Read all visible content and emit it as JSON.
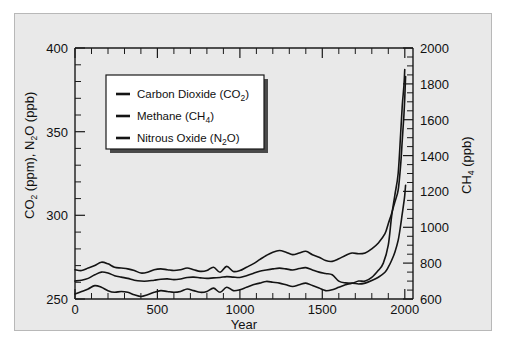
{
  "figure": {
    "background_color": "#e9e9e9",
    "page_color": "#ffffff",
    "line_color": "#141414"
  },
  "axes": {
    "x_label": "Year",
    "x_ticks": [
      "0",
      "500",
      "1000",
      "1500",
      "2000"
    ],
    "y_left_label_parts": {
      "a": "CO",
      "a_sub": "2",
      "b": " (ppm), N",
      "b_sub": "2",
      "c": "O (ppb)"
    },
    "y_left_ticks": [
      "250",
      "300",
      "350",
      "400"
    ],
    "y_right_label_parts": {
      "a": "CH",
      "a_sub": "4",
      "b": " (ppb)"
    },
    "y_right_ticks": [
      "600",
      "800",
      "1000",
      "1200",
      "1400",
      "1600",
      "1800",
      "2000"
    ]
  },
  "legend": {
    "items": [
      {
        "label_main": "Carbon Dioxide (CO",
        "label_sub": "2",
        "label_end": ")",
        "name": "carbon-dioxide"
      },
      {
        "label_main": "Methane (CH",
        "label_sub": "4",
        "label_end": ")",
        "name": "methane"
      },
      {
        "label_main": "Nitrous Oxide (N",
        "label_sub": "2",
        "label_end": "O)",
        "name": "nitrous-oxide"
      }
    ]
  },
  "chart_data": {
    "type": "line",
    "title": "",
    "xlabel": "Year",
    "ylabel": "CO2 (ppm), N2O (ppb)",
    "ylabel_right": "CH4 (ppb)",
    "xlim": [
      0,
      2050
    ],
    "ylim_left": [
      250,
      400
    ],
    "ylim_right": [
      600,
      2000
    ],
    "grid": false,
    "legend_position": "upper-left-inside",
    "series": [
      {
        "name": "Carbon Dioxide (CO2)",
        "unit": "ppm",
        "axis": "left",
        "x": [
          0,
          40,
          80,
          120,
          160,
          200,
          240,
          280,
          320,
          360,
          400,
          440,
          480,
          520,
          560,
          600,
          640,
          680,
          720,
          760,
          800,
          840,
          880,
          920,
          960,
          1000,
          1040,
          1080,
          1120,
          1160,
          1200,
          1240,
          1280,
          1320,
          1360,
          1400,
          1440,
          1480,
          1520,
          1560,
          1600,
          1640,
          1680,
          1720,
          1760,
          1800,
          1840,
          1880,
          1900,
          1920,
          1940,
          1960,
          1975,
          1985,
          1995,
          2000,
          2005
        ],
        "y": [
          267.5,
          267.0,
          268.5,
          270.0,
          272.0,
          271.0,
          269.0,
          268.5,
          268.0,
          267.0,
          265.5,
          266.0,
          267.5,
          268.0,
          267.5,
          267.0,
          267.5,
          268.5,
          267.5,
          266.5,
          267.0,
          269.0,
          266.0,
          269.5,
          266.5,
          267.0,
          269.0,
          271.0,
          273.5,
          276.0,
          278.0,
          279.0,
          278.0,
          276.5,
          277.5,
          278.5,
          276.5,
          275.0,
          273.0,
          272.5,
          274.0,
          276.0,
          277.5,
          277.0,
          277.5,
          280.0,
          283.5,
          289.0,
          295.0,
          301.0,
          308.0,
          315.0,
          330.0,
          345.0,
          360.0,
          370.0,
          383.0
        ]
      },
      {
        "name": "Methane (CH4)",
        "unit": "ppb",
        "axis": "right",
        "x": [
          0,
          40,
          80,
          120,
          160,
          200,
          240,
          280,
          320,
          360,
          400,
          440,
          480,
          520,
          560,
          600,
          640,
          680,
          720,
          760,
          800,
          840,
          880,
          920,
          960,
          1000,
          1040,
          1080,
          1120,
          1160,
          1200,
          1240,
          1280,
          1320,
          1360,
          1400,
          1440,
          1480,
          1520,
          1560,
          1600,
          1640,
          1680,
          1720,
          1760,
          1800,
          1840,
          1870,
          1900,
          1920,
          1940,
          1960,
          1975,
          1985,
          1995,
          2000
        ],
        "y": [
          700,
          705,
          715,
          735,
          750,
          745,
          730,
          722,
          715,
          705,
          700,
          700,
          705,
          710,
          712,
          708,
          712,
          720,
          722,
          718,
          715,
          718,
          720,
          725,
          722,
          720,
          730,
          742,
          755,
          762,
          768,
          772,
          768,
          762,
          770,
          775,
          762,
          750,
          742,
          735,
          700,
          690,
          688,
          700,
          700,
          720,
          760,
          800,
          900,
          1060,
          1180,
          1300,
          1520,
          1680,
          1790,
          1880
        ]
      },
      {
        "name": "Nitrous Oxide (N2O)",
        "unit": "ppb",
        "axis": "left",
        "x": [
          0,
          40,
          80,
          120,
          160,
          200,
          240,
          280,
          320,
          360,
          400,
          440,
          480,
          520,
          560,
          600,
          640,
          680,
          720,
          760,
          800,
          840,
          880,
          920,
          960,
          1000,
          1040,
          1080,
          1120,
          1160,
          1200,
          1240,
          1280,
          1320,
          1360,
          1400,
          1440,
          1480,
          1520,
          1560,
          1600,
          1640,
          1680,
          1720,
          1760,
          1800,
          1840,
          1880,
          1900,
          1920,
          1940,
          1960,
          1975,
          1985,
          1995,
          2000,
          2005
        ],
        "y": [
          253.0,
          254.5,
          256.0,
          258.0,
          257.0,
          255.0,
          254.0,
          254.5,
          254.0,
          252.5,
          251.5,
          252.5,
          254.0,
          255.0,
          254.5,
          254.0,
          254.5,
          256.0,
          255.0,
          254.0,
          254.5,
          256.5,
          254.0,
          257.0,
          255.0,
          255.5,
          257.0,
          258.5,
          259.5,
          260.5,
          260.0,
          259.5,
          258.5,
          257.5,
          258.5,
          259.5,
          258.0,
          256.5,
          255.0,
          255.5,
          257.0,
          258.5,
          259.5,
          259.0,
          259.5,
          261.0,
          263.0,
          266.0,
          269.0,
          273.0,
          278.0,
          285.0,
          294.0,
          301.0,
          308.0,
          312.0,
          318.0
        ]
      }
    ]
  }
}
